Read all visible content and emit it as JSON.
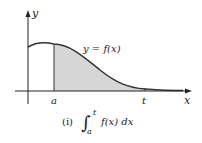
{
  "figure": {
    "axis_x_label": "x",
    "axis_y_label": "y",
    "curve_label": "y = f(x)",
    "lower_limit_label": "a",
    "upper_limit_label": "t",
    "caption_number": "(i)",
    "caption_integrand": "f(x) dx",
    "caption_lower": "a",
    "caption_upper": "t",
    "integral_sign": "∫",
    "fill_color": "#d6d6d6",
    "curve_color": "#333333"
  }
}
